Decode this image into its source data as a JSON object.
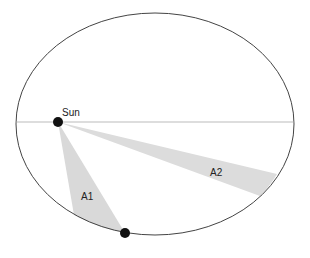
{
  "diagram": {
    "labels": {
      "sun": "Sun",
      "area1": "A1",
      "area2": "A2"
    },
    "colors": {
      "orbit": "#444444",
      "axis": "#999999",
      "area_fill": "#d9d9d9",
      "body": "#111111"
    }
  }
}
